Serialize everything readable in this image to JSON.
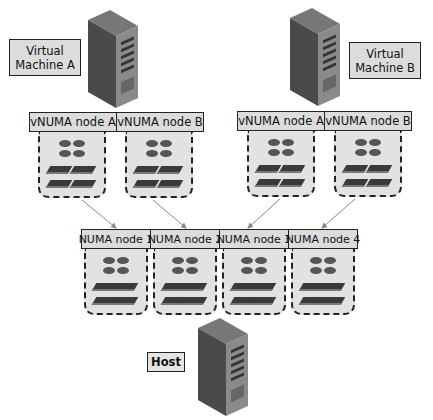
{
  "vm_a": {
    "label_line1": "Virtual",
    "label_line2": "Machine A",
    "vnuma_nodes": [
      {
        "label": "vNUMA node A"
      },
      {
        "label": "vNUMA node B"
      }
    ]
  },
  "vm_b": {
    "label_line1": "Virtual",
    "label_line2": "Machine B",
    "vnuma_nodes": [
      {
        "label": "vNUMA node A"
      },
      {
        "label": "vNUMA node B"
      }
    ]
  },
  "host": {
    "label": "Host",
    "numa_nodes": [
      {
        "label": "NUMA node 1"
      },
      {
        "label": "NUMA node 2"
      },
      {
        "label": "NUMA node 3"
      },
      {
        "label": "NUMA node 4"
      }
    ]
  },
  "icons": {
    "server": "server-tower-icon",
    "cpu": "cpu-icon",
    "memory": "memory-module-icon"
  },
  "mappings": [
    {
      "from": "VM A vNUMA node A",
      "to": "NUMA node 1"
    },
    {
      "from": "VM A vNUMA node B",
      "to": "NUMA node 2"
    },
    {
      "from": "VM B vNUMA node A",
      "to": "NUMA node 3"
    },
    {
      "from": "VM B vNUMA node B",
      "to": "NUMA node 4"
    }
  ]
}
